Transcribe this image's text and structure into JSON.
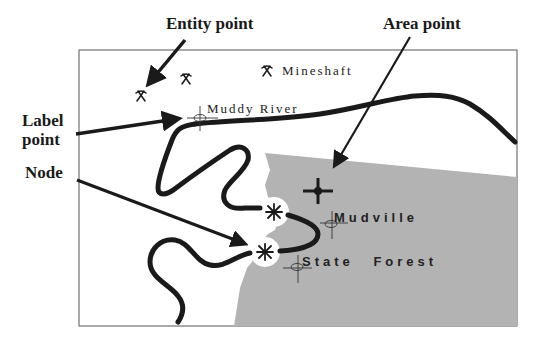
{
  "callouts": {
    "entity_point": "Entity point",
    "area_point": "Area point",
    "label_point_line1": "Label",
    "label_point_line2": "point",
    "node": "Node"
  },
  "map": {
    "labels": {
      "mineshaft": "Mineshaft",
      "muddy_river": "Muddy River",
      "mudville": "Mudville",
      "state_forest": "State Forest"
    },
    "icons": [
      "mine-pickaxe-icon",
      "mine-pickaxe-icon",
      "mine-pickaxe-icon",
      "label-point-marker-icon",
      "area-point-marker-icon",
      "node-asterisk-icon"
    ],
    "colors": {
      "area_fill": "#b3b3b3",
      "line": "#1a1a1a",
      "frame": "#555555",
      "background": "#ffffff"
    }
  }
}
